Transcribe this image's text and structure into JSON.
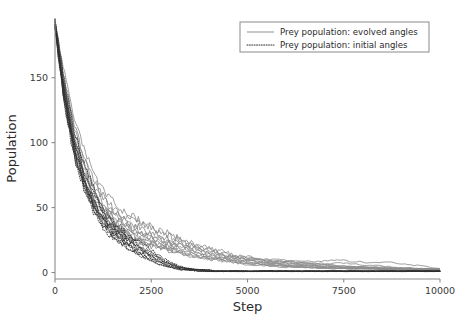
{
  "figure": {
    "background": "#ffffff",
    "plot_area": {
      "left": 55,
      "right": 440,
      "top": 18,
      "bottom": 279
    }
  },
  "chart_data": {
    "type": "line",
    "title": "",
    "xlabel": "Step",
    "ylabel": "Population",
    "xlim": [
      0,
      10000
    ],
    "ylim": [
      -5,
      196
    ],
    "xticks": [
      0,
      2500,
      5000,
      7500,
      10000
    ],
    "xtick_labels": [
      "0",
      "2500",
      "5000",
      "7500",
      "10000"
    ],
    "yticks": [
      0,
      50,
      100,
      150
    ],
    "ytick_labels": [
      "0",
      "50",
      "100",
      "150"
    ],
    "grid": false,
    "legend": {
      "position": "upper right",
      "entries": [
        {
          "label": "Prey population: evolved angles",
          "style": "solid",
          "color": "#8c8c8c"
        },
        {
          "label": "Prey population: initial angles",
          "style": "dotted",
          "color": "#2e2e2e"
        }
      ]
    },
    "x": [
      0,
      250,
      500,
      750,
      1000,
      1250,
      1500,
      1750,
      2000,
      2250,
      2500,
      2750,
      3000,
      3250,
      3500,
      3750,
      4000,
      4250,
      4500,
      4750,
      5000,
      5500,
      6000,
      6500,
      7000,
      7500,
      8000,
      8500,
      9000,
      9500,
      10000
    ],
    "series": [
      {
        "name": "evolved-run-1",
        "style": "solid",
        "values": [
          192,
          139,
          101,
          76,
          60,
          48,
          40,
          34,
          30,
          27,
          25,
          22,
          20,
          18,
          17,
          15,
          13,
          12,
          11,
          10,
          9,
          8,
          7,
          6,
          5,
          4,
          4,
          3,
          3,
          3,
          3
        ]
      },
      {
        "name": "evolved-run-2",
        "style": "solid",
        "values": [
          191,
          143,
          108,
          84,
          66,
          54,
          45,
          39,
          35,
          32,
          29,
          26,
          23,
          21,
          19,
          17,
          15,
          13,
          12,
          11,
          10,
          9,
          8,
          8,
          7,
          7,
          6,
          5,
          4,
          3,
          2
        ]
      },
      {
        "name": "evolved-run-3",
        "style": "solid",
        "values": [
          190,
          134,
          96,
          71,
          55,
          44,
          36,
          31,
          27,
          24,
          22,
          20,
          18,
          16,
          14,
          12,
          11,
          10,
          9,
          8,
          7,
          6,
          5,
          4,
          4,
          3,
          3,
          3,
          2,
          2,
          2
        ]
      },
      {
        "name": "evolved-run-4",
        "style": "solid",
        "values": [
          193,
          148,
          114,
          90,
          72,
          59,
          50,
          44,
          40,
          37,
          34,
          31,
          28,
          25,
          22,
          20,
          18,
          16,
          14,
          12,
          11,
          10,
          9,
          9,
          9,
          9,
          8,
          8,
          7,
          5,
          3
        ]
      },
      {
        "name": "evolved-run-5",
        "style": "solid",
        "values": [
          190,
          136,
          99,
          74,
          57,
          46,
          38,
          33,
          29,
          26,
          24,
          21,
          19,
          17,
          15,
          14,
          12,
          11,
          10,
          9,
          8,
          7,
          6,
          5,
          4,
          4,
          3,
          3,
          3,
          2,
          2
        ]
      },
      {
        "name": "evolved-run-6",
        "style": "solid",
        "values": [
          192,
          141,
          105,
          80,
          63,
          51,
          43,
          37,
          33,
          30,
          27,
          25,
          23,
          21,
          19,
          18,
          16,
          14,
          12,
          11,
          10,
          8,
          7,
          6,
          5,
          4,
          4,
          3,
          3,
          3,
          2
        ]
      },
      {
        "name": "evolved-run-7",
        "style": "solid",
        "values": [
          189,
          131,
          93,
          69,
          53,
          42,
          35,
          30,
          26,
          23,
          21,
          19,
          17,
          15,
          13,
          12,
          10,
          9,
          8,
          7,
          6,
          5,
          4,
          4,
          3,
          3,
          3,
          2,
          2,
          2,
          2
        ]
      },
      {
        "name": "evolved-run-8",
        "style": "solid",
        "values": [
          194,
          152,
          119,
          95,
          77,
          64,
          55,
          48,
          43,
          39,
          35,
          32,
          29,
          26,
          24,
          21,
          19,
          17,
          15,
          13,
          12,
          10,
          9,
          7,
          6,
          5,
          4,
          4,
          3,
          3,
          3
        ]
      },
      {
        "name": "evolved-run-9",
        "style": "solid",
        "values": [
          191,
          138,
          102,
          78,
          61,
          50,
          42,
          36,
          32,
          29,
          26,
          24,
          22,
          20,
          18,
          16,
          14,
          13,
          11,
          10,
          9,
          7,
          6,
          5,
          5,
          4,
          4,
          3,
          3,
          2,
          2
        ]
      },
      {
        "name": "evolved-run-10",
        "style": "solid",
        "values": [
          190,
          133,
          95,
          70,
          54,
          43,
          36,
          31,
          27,
          24,
          22,
          20,
          18,
          16,
          15,
          13,
          12,
          11,
          10,
          9,
          8,
          6,
          5,
          4,
          4,
          3,
          3,
          3,
          2,
          2,
          2
        ]
      },
      {
        "name": "evolved-run-11",
        "style": "solid",
        "values": [
          192,
          145,
          111,
          87,
          70,
          57,
          48,
          42,
          38,
          34,
          31,
          28,
          26,
          23,
          21,
          19,
          17,
          15,
          13,
          12,
          11,
          9,
          8,
          7,
          6,
          5,
          4,
          4,
          3,
          3,
          3
        ]
      },
      {
        "name": "evolved-run-12",
        "style": "solid",
        "values": [
          189,
          130,
          92,
          68,
          52,
          41,
          34,
          29,
          25,
          22,
          20,
          18,
          16,
          15,
          13,
          12,
          11,
          10,
          9,
          8,
          7,
          6,
          5,
          4,
          3,
          3,
          3,
          2,
          2,
          2,
          2
        ]
      },
      {
        "name": "initial-run-1",
        "style": "dotted",
        "values": [
          192,
          137,
          98,
          72,
          55,
          42,
          33,
          27,
          22,
          18,
          14,
          10,
          7,
          4,
          3,
          2,
          2,
          1,
          1,
          1,
          1,
          1,
          1,
          1,
          1,
          1,
          1,
          1,
          1,
          1,
          1
        ]
      },
      {
        "name": "initial-run-2",
        "style": "dotted",
        "values": [
          190,
          133,
          94,
          68,
          51,
          39,
          30,
          24,
          19,
          15,
          11,
          8,
          5,
          3,
          2,
          2,
          1,
          1,
          1,
          1,
          1,
          1,
          1,
          1,
          1,
          1,
          1,
          1,
          1,
          1,
          1
        ]
      },
      {
        "name": "initial-run-3",
        "style": "dotted",
        "values": [
          193,
          142,
          104,
          78,
          60,
          47,
          37,
          30,
          25,
          20,
          16,
          11,
          7,
          4,
          3,
          2,
          2,
          1,
          1,
          1,
          1,
          1,
          1,
          1,
          1,
          1,
          1,
          1,
          1,
          1,
          1
        ]
      },
      {
        "name": "initial-run-4",
        "style": "dotted",
        "values": [
          191,
          135,
          96,
          70,
          53,
          40,
          31,
          25,
          20,
          16,
          12,
          8,
          5,
          3,
          2,
          2,
          1,
          1,
          1,
          1,
          1,
          1,
          1,
          1,
          1,
          1,
          1,
          1,
          1,
          1,
          1
        ]
      },
      {
        "name": "initial-run-5",
        "style": "dotted",
        "values": [
          189,
          129,
          90,
          65,
          48,
          36,
          28,
          22,
          17,
          13,
          9,
          6,
          4,
          2,
          2,
          1,
          1,
          1,
          1,
          1,
          1,
          1,
          1,
          1,
          1,
          1,
          1,
          1,
          1,
          1,
          1
        ]
      },
      {
        "name": "initial-run-6",
        "style": "dotted",
        "values": [
          194,
          147,
          110,
          84,
          65,
          51,
          41,
          33,
          27,
          22,
          17,
          12,
          8,
          5,
          3,
          2,
          2,
          1,
          1,
          1,
          1,
          1,
          1,
          1,
          1,
          1,
          1,
          1,
          1,
          1,
          1
        ]
      },
      {
        "name": "initial-run-7",
        "style": "dotted",
        "values": [
          190,
          132,
          93,
          67,
          50,
          38,
          29,
          23,
          18,
          14,
          10,
          7,
          4,
          3,
          2,
          1,
          1,
          1,
          1,
          1,
          1,
          1,
          1,
          1,
          1,
          1,
          1,
          1,
          1,
          1,
          1
        ]
      },
      {
        "name": "initial-run-8",
        "style": "dotted",
        "values": [
          192,
          139,
          100,
          74,
          57,
          44,
          35,
          28,
          23,
          18,
          14,
          10,
          6,
          4,
          3,
          2,
          1,
          1,
          1,
          1,
          1,
          1,
          1,
          1,
          1,
          1,
          1,
          1,
          1,
          1,
          1
        ]
      },
      {
        "name": "initial-run-9",
        "style": "dotted",
        "values": [
          191,
          136,
          97,
          71,
          54,
          41,
          32,
          26,
          21,
          17,
          13,
          9,
          6,
          4,
          2,
          2,
          1,
          1,
          1,
          1,
          1,
          1,
          1,
          1,
          1,
          1,
          1,
          1,
          1,
          1,
          1
        ]
      },
      {
        "name": "initial-run-10",
        "style": "dotted",
        "values": [
          189,
          128,
          89,
          64,
          47,
          35,
          27,
          21,
          16,
          12,
          9,
          6,
          4,
          2,
          2,
          1,
          1,
          1,
          1,
          1,
          1,
          1,
          1,
          1,
          1,
          1,
          1,
          1,
          1,
          1,
          1
        ]
      }
    ]
  }
}
